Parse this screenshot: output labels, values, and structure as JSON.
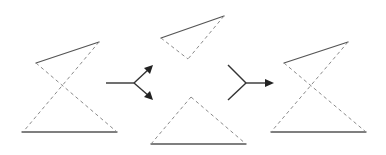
{
  "diagram": {
    "colors": {
      "solid_line": "#555555",
      "dashed_line": "#8a8a8a",
      "arrow": "#333333",
      "background": "#ffffff"
    },
    "shapes": [
      {
        "id": "input-hourglass",
        "solid": [
          [
            36,
            63,
            99,
            42
          ],
          [
            22,
            132,
            117,
            132
          ]
        ],
        "dashed": [
          [
            36,
            63,
            117,
            132
          ],
          [
            99,
            42,
            23,
            132
          ]
        ]
      },
      {
        "id": "top-triangle",
        "solid": [
          [
            161,
            38,
            224,
            16
          ]
        ],
        "dashed": [
          [
            161,
            38,
            188,
            59
          ],
          [
            224,
            16,
            188,
            59
          ]
        ]
      },
      {
        "id": "bottom-triangle",
        "solid": [
          [
            151,
            144,
            246,
            144
          ]
        ],
        "dashed": [
          [
            151,
            144,
            191,
            97
          ],
          [
            191,
            97,
            246,
            144
          ]
        ]
      },
      {
        "id": "output-hourglass",
        "solid": [
          [
            284,
            63,
            348,
            42
          ],
          [
            271,
            132,
            366,
            132
          ]
        ],
        "dashed": [
          [
            284,
            63,
            366,
            132
          ],
          [
            348,
            42,
            271,
            132
          ]
        ]
      }
    ],
    "arrows": [
      {
        "id": "split-arrow",
        "type": "split",
        "from": [
          106,
          83
        ],
        "junction": [
          134,
          83
        ],
        "to": [
          [
            152,
            66
          ],
          [
            152,
            99
          ]
        ]
      },
      {
        "id": "merge-arrow",
        "type": "merge",
        "from": [
          [
            228,
            65
          ],
          [
            228,
            100
          ]
        ],
        "junction": [
          246,
          83
        ],
        "to": [
          [
            273,
            83
          ]
        ]
      }
    ]
  }
}
